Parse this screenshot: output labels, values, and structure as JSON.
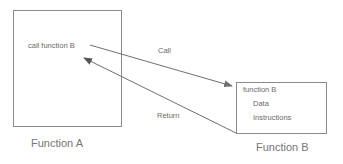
{
  "diagram": {
    "colors": {
      "stroke": "#8a8a8a",
      "text": "#6b6b6b",
      "caption": "#767676",
      "background": "#ffffff"
    },
    "boxes": [
      {
        "id": "function-a",
        "caption": "Function A",
        "lines": [
          "call function B"
        ]
      },
      {
        "id": "function-b",
        "caption": "Function B",
        "lines": [
          "function B",
          "Data",
          "Instructions"
        ]
      }
    ],
    "arrows": [
      {
        "id": "call",
        "label": "Call",
        "from": "function-a",
        "to": "function-b"
      },
      {
        "id": "return",
        "label": "Return",
        "from": "function-b",
        "to": "function-a"
      }
    ]
  }
}
